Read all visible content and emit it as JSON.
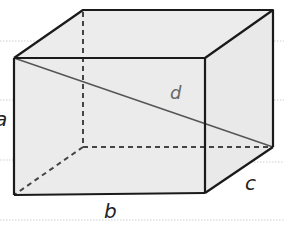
{
  "figure": {
    "type": "rectangular box (cuboid) with space diagonal",
    "colors": {
      "background": "#ffffff",
      "face_fill": "#ececec",
      "edge": "#1a1a1a",
      "hidden_edge": "#444444",
      "diagonal": "#555555",
      "bg_rule": "#cfcfcf"
    },
    "labels": {
      "a": "a",
      "b": "b",
      "c": "c",
      "d": "d"
    },
    "vertices": {
      "front_top_left": [
        14,
        58
      ],
      "front_top_right": [
        205,
        58
      ],
      "front_bottom_right": [
        205,
        193
      ],
      "front_bottom_left": [
        14,
        195
      ],
      "back_top_left": [
        83,
        10
      ],
      "back_top_right": [
        273,
        10
      ],
      "back_bottom_right": [
        273,
        147
      ],
      "back_bottom_left": [
        83,
        147
      ]
    }
  }
}
